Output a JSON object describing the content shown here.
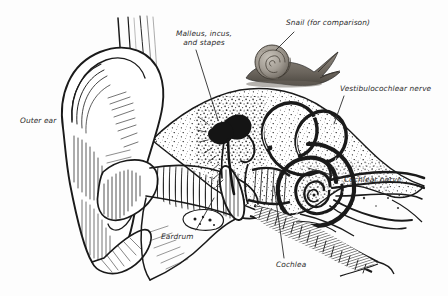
{
  "figure": {
    "type": "anatomical-line-diagram",
    "background_color": "#fdfdfd",
    "ink_color": "#1a1a1a",
    "label_color": "#2b2b2b",
    "width": 448,
    "height": 296
  },
  "labels": {
    "outer_ear": "Outer ear",
    "ossicles_line1": "Malleus, incus,",
    "ossicles_line2": "and stapes",
    "snail": "Snail (for comparison)",
    "vestibulocochlear_nerve": "Vestibulocochlear nerve",
    "cochlear_nerve": "Cochlear nerve",
    "eardrum": "Eardrum",
    "cochlea": "Cochlea"
  },
  "structures": {
    "pinna": "outer-ear-pinna",
    "ear_canal": "external-auditory-canal",
    "tympanic_membrane": "eardrum",
    "ossicles": "malleus-incus-stapes",
    "semicircular_canals": "semicircular-canals",
    "cochlea_spiral": "cochlea",
    "nerve_bundle": "vestibulocochlear-nerve",
    "eustachian_tube": "eustachian-tube",
    "temporal_bone": "temporal-bone-stipple",
    "snail_illustration": "snail-engraving"
  }
}
